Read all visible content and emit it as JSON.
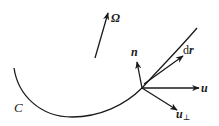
{
  "diagram": {
    "curve_label": "C",
    "omega_label": "Ω",
    "n_label": "n",
    "dr_label_d": "d",
    "dr_label_r": "r",
    "u_label": "u",
    "uperp_label_u": "u",
    "uperp_label_sub": "⊥",
    "stroke_color": "#1a1a1a",
    "background_color": "#ffffff"
  }
}
